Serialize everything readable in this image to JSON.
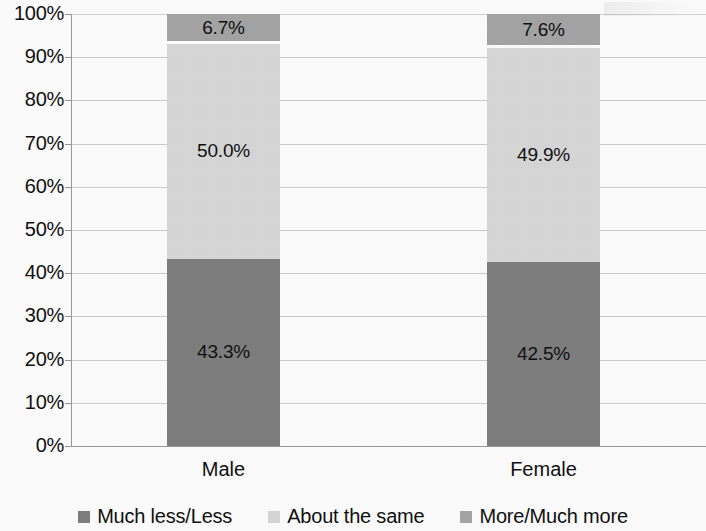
{
  "chart_data": {
    "type": "bar",
    "subtype": "stacked-100-percent",
    "title": "",
    "xlabel": "",
    "ylabel": "",
    "categories": [
      "Male",
      "Female"
    ],
    "ylim": [
      0,
      100
    ],
    "ytick_labels": [
      "0%",
      "10%",
      "20%",
      "30%",
      "40%",
      "50%",
      "60%",
      "70%",
      "80%",
      "90%",
      "100%"
    ],
    "ytick_values": [
      0,
      10,
      20,
      30,
      40,
      50,
      60,
      70,
      80,
      90,
      100
    ],
    "grid": true,
    "legend_position": "bottom",
    "series": [
      {
        "name": "Much less/Less",
        "color": "#808080",
        "values": [
          43.3,
          42.5
        ],
        "labels": [
          "43.3%",
          "42.5%"
        ]
      },
      {
        "name": "About the same",
        "color": "#d9d9d9",
        "values": [
          50.0,
          49.9
        ],
        "labels": [
          "50.0%",
          "49.9%"
        ]
      },
      {
        "name": "More/Much more",
        "color": "#a6a6a6",
        "values": [
          6.7,
          7.6
        ],
        "labels": [
          "6.7%",
          "7.6%"
        ]
      }
    ],
    "segment_gap_color": "#ffffff"
  },
  "axis": {
    "ticks": [
      {
        "label": "100%",
        "value": 100
      },
      {
        "label": "90%",
        "value": 90
      },
      {
        "label": "80%",
        "value": 80
      },
      {
        "label": "70%",
        "value": 70
      },
      {
        "label": "60%",
        "value": 60
      },
      {
        "label": "50%",
        "value": 50
      },
      {
        "label": "40%",
        "value": 40
      },
      {
        "label": "30%",
        "value": 30
      },
      {
        "label": "20%",
        "value": 20
      },
      {
        "label": "10%",
        "value": 10
      },
      {
        "label": "0%",
        "value": 0
      }
    ]
  },
  "bars": [
    {
      "category": "Male",
      "segments": [
        {
          "series": "Much less/Less",
          "value": 43.3,
          "label": "43.3%",
          "color": "#808080",
          "show_label": true
        },
        {
          "series": "About the same",
          "value": 50.0,
          "label": "50.0%",
          "color": "#d9d9d9",
          "show_label": true
        },
        {
          "series": "More/Much more",
          "value": 6.7,
          "label": "6.7%",
          "color": "#a6a6a6",
          "show_label": true
        }
      ]
    },
    {
      "category": "Female",
      "segments": [
        {
          "series": "Much less/Less",
          "value": 42.5,
          "label": "42.5%",
          "color": "#808080",
          "show_label": true
        },
        {
          "series": "About the same",
          "value": 49.9,
          "label": "49.9%",
          "color": "#d9d9d9",
          "show_label": true
        },
        {
          "series": "More/Much more",
          "value": 7.6,
          "label": "7.6%",
          "color": "#a6a6a6",
          "show_label": true
        }
      ]
    }
  ],
  "legend": {
    "items": [
      {
        "label": "Much less/Less",
        "color": "#808080"
      },
      {
        "label": "About the same",
        "color": "#d9d9d9"
      },
      {
        "label": "More/Much more",
        "color": "#a6a6a6"
      }
    ]
  },
  "colors": {
    "much_less_less": "#808080",
    "about_the_same": "#d9d9d9",
    "more_much_more": "#a6a6a6",
    "gridline": "#bdbdbd",
    "axis": "#9a9a9a",
    "text": "#111111",
    "background": "#ffffff"
  }
}
